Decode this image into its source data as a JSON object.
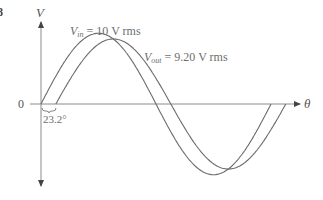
{
  "figure": {
    "figure_number_fragment": "8",
    "y_axis_label": "V",
    "x_axis_label": "θ",
    "origin_label": "0",
    "phase_label": "23.2°",
    "vin_label": {
      "symbol": "V",
      "subscript": "in",
      "value": " = 10 V rms"
    },
    "vout_label": {
      "symbol": "V",
      "subscript": "out",
      "value": " = 9.20 V rms"
    }
  },
  "chart_data": {
    "type": "line",
    "title": "",
    "xlabel": "θ",
    "ylabel": "V",
    "series": [
      {
        "name": "V_in",
        "rms": 10,
        "unit": "V rms",
        "phase_deg": 0,
        "cycles": 1
      },
      {
        "name": "V_out",
        "rms": 9.2,
        "unit": "V rms",
        "phase_deg": 23.2,
        "cycles": 1
      }
    ],
    "annotations": [
      "V_in = 10 V rms",
      "V_out = 9.20 V rms",
      "23.2°"
    ],
    "grid": false,
    "legend": "none"
  },
  "colors": {
    "curve": "#6a6a6a",
    "axis": "#8a8a8a",
    "text": "#6e6e6e"
  }
}
